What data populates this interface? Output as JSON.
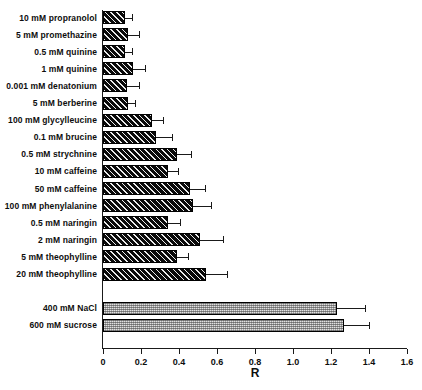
{
  "chart_data": {
    "type": "bar",
    "orientation": "horizontal",
    "title": "",
    "xlabel": "R",
    "ylabel": "",
    "xlim": [
      0,
      1.6
    ],
    "xticks": [
      "0",
      "0.2",
      "0.4",
      "0.6",
      "0.8",
      "1.0",
      "1.2",
      "1.4",
      "1.6"
    ],
    "xtick_values": [
      0,
      0.2,
      0.4,
      0.6,
      0.8,
      1.0,
      1.2,
      1.4,
      1.6
    ],
    "grid": false,
    "legend": null,
    "categories": [
      "10 mM propranolol",
      "5 mM promethazine",
      "0.5 mM quinine",
      "1 mM quinine",
      "0.001 mM denatonium",
      "5 mM berberine",
      "100 mM glycylleucine",
      "0.1 mM brucine",
      "0.5 mM strychnine",
      "10 mM caffeine",
      "50 mM caffeine",
      "100 mM phenylalanine",
      "0.5 mM naringin",
      "2 mM naringin",
      "5 mM theophylline",
      "20 mM theophylline",
      "400 mM NaCl",
      "600 mM sucrose"
    ],
    "values": [
      0.115,
      0.13,
      0.115,
      0.16,
      0.125,
      0.13,
      0.26,
      0.28,
      0.39,
      0.34,
      0.46,
      0.475,
      0.34,
      0.51,
      0.39,
      0.54,
      1.23,
      1.27
    ],
    "errors": [
      0.04,
      0.06,
      0.04,
      0.06,
      0.065,
      0.04,
      0.055,
      0.085,
      0.075,
      0.055,
      0.075,
      0.095,
      0.065,
      0.12,
      0.055,
      0.115,
      0.15,
      0.13
    ],
    "groups": [
      {
        "name": "bitter-compounds",
        "fill": "hatched",
        "from": 0,
        "to": 15
      },
      {
        "name": "reference-tastants",
        "fill": "stippled",
        "from": 16,
        "to": 17
      }
    ],
    "colors": {
      "bar_hatched_fill": "#0a0a0a",
      "bar_stippled_fill": "#a8a8a8",
      "axis": "#1a1a1a",
      "text": "#0d0d0d",
      "background": "#ffffff"
    }
  }
}
